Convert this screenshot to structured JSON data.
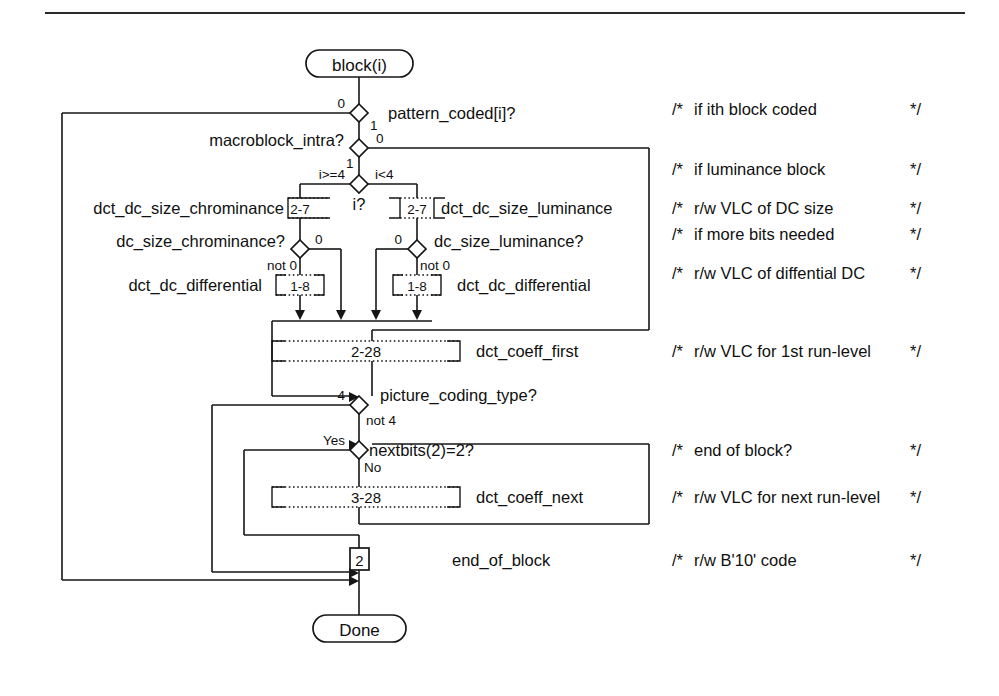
{
  "diagram": {
    "terminals": {
      "start": "block(i)",
      "end": "Done"
    },
    "decisions": [
      {
        "id": "pattern_coded",
        "label": "pattern_coded[i]?",
        "branch_a": "0",
        "branch_b": "1"
      },
      {
        "id": "macroblock_intra",
        "label": "macroblock_intra?",
        "branch_a": "0",
        "branch_b": "1"
      },
      {
        "id": "i_test",
        "label": "i?",
        "branch_a": "i>=4",
        "branch_b": "i<4"
      },
      {
        "id": "dc_size_chrominance",
        "label": "dc_size_chrominance?",
        "branch_a": "0",
        "branch_b": "not 0"
      },
      {
        "id": "dc_size_luminance",
        "label": "dc_size_luminance?",
        "branch_a": "0",
        "branch_b": "not 0"
      },
      {
        "id": "picture_coding_type",
        "label": "picture_coding_type?",
        "branch_a": "4",
        "branch_b": "not 4"
      },
      {
        "id": "nextbits",
        "label": "nextbits(2)=2?",
        "branch_a": "Yes",
        "branch_b": "No"
      }
    ],
    "elements": [
      {
        "id": "dct_dc_size_chrominance",
        "label": "dct_dc_size_chrominance",
        "bits": "2-7",
        "kind": "vlc",
        "label_side": "left"
      },
      {
        "id": "dct_dc_size_luminance",
        "label": "dct_dc_size_luminance",
        "bits": "2-7",
        "kind": "vlc",
        "label_side": "right"
      },
      {
        "id": "dct_dc_differential_left",
        "label": "dct_dc_differential",
        "bits": "1-8",
        "kind": "vlc",
        "label_side": "left"
      },
      {
        "id": "dct_dc_differential_right",
        "label": "dct_dc_differential",
        "bits": "1-8",
        "kind": "vlc",
        "label_side": "right"
      },
      {
        "id": "dct_coeff_first",
        "label": "dct_coeff_first",
        "bits": "2-28",
        "kind": "vlc",
        "label_side": "right"
      },
      {
        "id": "dct_coeff_next",
        "label": "dct_coeff_next",
        "bits": "3-28",
        "kind": "vlc",
        "label_side": "right"
      },
      {
        "id": "end_of_block",
        "label": "end_of_block",
        "bits": "2",
        "kind": "fixed",
        "label_side": "right"
      }
    ],
    "comments": [
      {
        "open": "/*",
        "text": "if ith block coded",
        "close": "*/"
      },
      {
        "open": "/*",
        "text": "if luminance block",
        "close": "*/"
      },
      {
        "open": "/*",
        "text": "r/w VLC of DC size",
        "close": "*/"
      },
      {
        "open": "/*",
        "text": "if more bits needed",
        "close": "*/"
      },
      {
        "open": "/*",
        "text": "r/w VLC of diffential DC",
        "close": "*/"
      },
      {
        "open": "/*",
        "text": "r/w VLC for 1st run-level",
        "close": "*/"
      },
      {
        "open": "/*",
        "text": "end of block?",
        "close": "*/"
      },
      {
        "open": "/*",
        "text": "r/w VLC for next run-level",
        "close": "*/"
      },
      {
        "open": "/*",
        "text": "r/w B'10' code",
        "close": "*/"
      }
    ],
    "colors": {
      "ink": "#161616",
      "paper": "#ffffff"
    }
  }
}
